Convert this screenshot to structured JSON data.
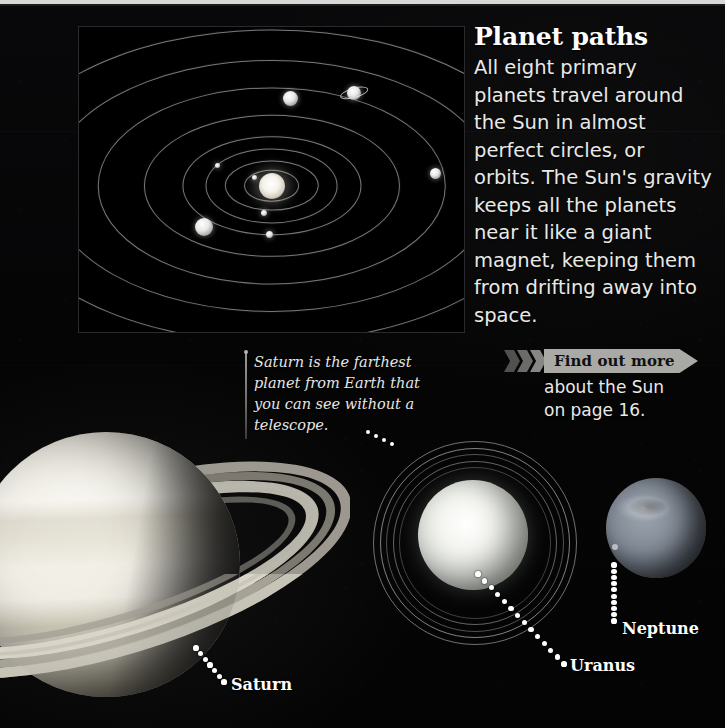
{
  "article": {
    "title": "Planet paths",
    "body": "All eight primary planets travel around the Sun in almost perfect circles, or orbits. The Sun's gravity keeps all the planets near it like a giant magnet, keeping them from drifting away into space."
  },
  "saturn_note": {
    "text": "Saturn is the farthest planet from Earth that you can see without a telescope."
  },
  "find_out_more": {
    "tag_label": "Find out more",
    "sub_line1": "about the Sun",
    "sub_line2": "on page 16."
  },
  "planet_labels": {
    "saturn": "Saturn",
    "uranus": "Uranus",
    "neptune": "Neptune"
  },
  "orbit_diagram": {
    "caption": "",
    "sun": "Sun",
    "orbit_count": 8,
    "planet_count": 8
  },
  "chart_data": {
    "type": "scatter",
    "title": "Planet paths",
    "xlabel": "",
    "ylabel": "",
    "grid": false,
    "legend": "none",
    "orbits": [
      {
        "name": "orbit-1",
        "rx_pct": 7,
        "ry_pct": 5
      },
      {
        "name": "orbit-2",
        "rx_pct": 12,
        "ry_pct": 8
      },
      {
        "name": "orbit-3",
        "rx_pct": 17,
        "ry_pct": 12
      },
      {
        "name": "orbit-4",
        "rx_pct": 23,
        "ry_pct": 16
      },
      {
        "name": "orbit-5",
        "rx_pct": 33,
        "ry_pct": 23
      },
      {
        "name": "orbit-6",
        "rx_pct": 45,
        "ry_pct": 32
      },
      {
        "name": "orbit-7",
        "rx_pct": 58,
        "ry_pct": 41
      },
      {
        "name": "orbit-8",
        "rx_pct": 72,
        "ry_pct": 51
      }
    ],
    "bodies": [
      {
        "name": "Sun",
        "x_pct": 50.0,
        "y_pct": 52.0,
        "size_px": 26,
        "ringed": false
      },
      {
        "name": "Mercury",
        "x_pct": 45.5,
        "y_pct": 49.5,
        "size_px": 5,
        "ringed": false
      },
      {
        "name": "Venus",
        "x_pct": 48.0,
        "y_pct": 61.0,
        "size_px": 6,
        "ringed": false
      },
      {
        "name": "Earth",
        "x_pct": 49.5,
        "y_pct": 68.0,
        "size_px": 7,
        "ringed": false
      },
      {
        "name": "Mars",
        "x_pct": 36.0,
        "y_pct": 45.5,
        "size_px": 5,
        "ringed": false
      },
      {
        "name": "Jupiter",
        "x_pct": 32.5,
        "y_pct": 65.5,
        "size_px": 18,
        "ringed": false
      },
      {
        "name": "Saturn",
        "x_pct": 55.0,
        "y_pct": 23.5,
        "size_px": 15,
        "ringed": false
      },
      {
        "name": "Uranus",
        "x_pct": 71.5,
        "y_pct": 21.5,
        "size_px": 14,
        "ringed": true
      },
      {
        "name": "Neptune",
        "x_pct": 92.5,
        "y_pct": 48.0,
        "size_px": 11,
        "ringed": false
      }
    ]
  }
}
